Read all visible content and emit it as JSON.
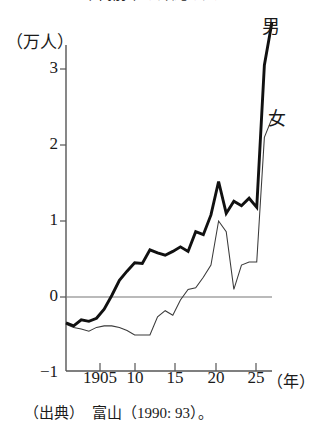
{
  "figure": {
    "title_cut_off": "1/35—1/25 年代前半の沖縄の入",
    "source_note": "（出典）　富山（1990: 93）。"
  },
  "axes": {
    "y_unit_label": "（万人）",
    "y_ticks": [
      "3",
      "2",
      "1",
      "0",
      "−1"
    ],
    "x_ticks": [
      "1905",
      "10",
      "15",
      "20",
      "25"
    ],
    "x_unit_label": "（年）"
  },
  "legend": {
    "male_label": "男",
    "female_label": "女"
  },
  "colors": {
    "ink": "#1a1a1a",
    "axis": "#555555",
    "zero_line": "#777777",
    "male_line": "#111111",
    "female_line": "#3a3a3a",
    "background": "#ffffff"
  },
  "chart_data": {
    "type": "line",
    "title": "1/35—1/25 年代前半の沖縄の入",
    "xlabel": "（年）",
    "ylabel": "（万人）",
    "xlim": [
      1899,
      1926
    ],
    "ylim": [
      -1,
      3.75
    ],
    "grid": false,
    "zero_reference_line": 0,
    "legend_position": "inline-right-of-line-ends",
    "x": [
      1899,
      1900,
      1901,
      1902,
      1903,
      1904,
      1905,
      1906,
      1907,
      1908,
      1909,
      1910,
      1911,
      1912,
      1913,
      1914,
      1915,
      1916,
      1917,
      1918,
      1919,
      1920,
      1921,
      1922,
      1923,
      1924,
      1925,
      1926
    ],
    "series": [
      {
        "name": "男",
        "style": "thick",
        "values": [
          -0.34,
          -0.38,
          -0.3,
          -0.32,
          -0.28,
          -0.16,
          0.02,
          0.22,
          0.34,
          0.45,
          0.44,
          0.62,
          0.58,
          0.55,
          0.6,
          0.66,
          0.6,
          0.86,
          0.82,
          1.08,
          1.52,
          1.1,
          1.26,
          1.2,
          1.3,
          1.18,
          3.05,
          3.62
        ]
      },
      {
        "name": "女",
        "style": "thin",
        "values": [
          -0.36,
          -0.4,
          -0.42,
          -0.45,
          -0.4,
          -0.38,
          -0.38,
          -0.4,
          -0.44,
          -0.5,
          -0.5,
          -0.5,
          -0.26,
          -0.18,
          -0.24,
          -0.04,
          0.1,
          0.12,
          0.26,
          0.42,
          1.0,
          0.86,
          0.1,
          0.42,
          0.46,
          0.46,
          2.1,
          2.35
        ]
      }
    ]
  }
}
